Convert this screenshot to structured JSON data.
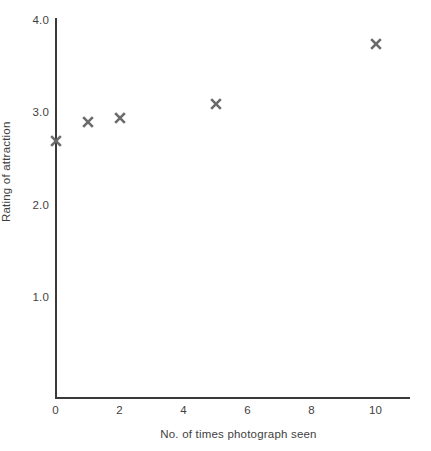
{
  "chart_data": {
    "type": "scatter",
    "title": "",
    "xlabel": "No. of times photograph seen",
    "ylabel": "Rating of attraction",
    "xlim": [
      0,
      11.1
    ],
    "ylim": [
      0,
      4.1
    ],
    "grid": false,
    "legend": "none",
    "x_ticks": [
      "0",
      "2",
      "4",
      "6",
      "8",
      "10"
    ],
    "x_tick_values": [
      0,
      2,
      4,
      6,
      8,
      10
    ],
    "y_ticks": [
      "1.0",
      "2.0",
      "3.0",
      "4.0"
    ],
    "y_tick_values": [
      1.0,
      2.0,
      3.0,
      4.0
    ],
    "marker_style": "x",
    "marker_color": "#6b6b6b",
    "axis_color": "#3a3a3a",
    "text_color": "#3f3f3f",
    "x": [
      0,
      1,
      2,
      5,
      10
    ],
    "values": [
      2.7,
      2.9,
      2.95,
      3.1,
      3.75
    ],
    "points": [
      {
        "x": 0,
        "y": 2.7
      },
      {
        "x": 1,
        "y": 2.9
      },
      {
        "x": 2,
        "y": 2.95
      },
      {
        "x": 5,
        "y": 3.1
      },
      {
        "x": 10,
        "y": 3.75
      }
    ]
  }
}
